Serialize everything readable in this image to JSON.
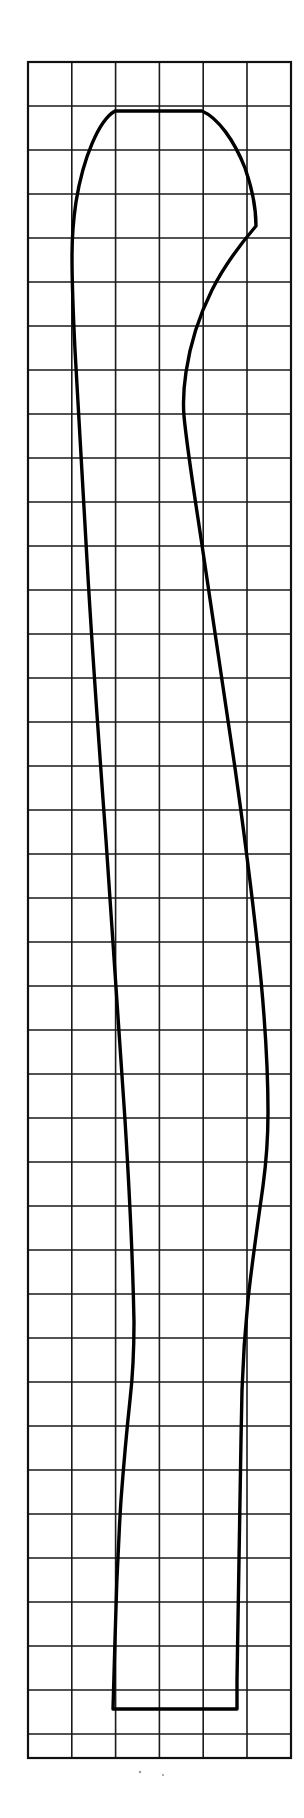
{
  "figure": {
    "background_color": "#ffffff",
    "line_color": "#000000",
    "grid_line_color": "#1a1a1a",
    "canvas": {
      "width": 304,
      "height": 1818
    }
  },
  "grid": {
    "name": "measuring-grid",
    "left": 28,
    "top": 62,
    "right": 291,
    "bottom": 1758,
    "columns": 6,
    "column_width": 43.8,
    "row_height": 44,
    "full_rows": 38,
    "partial_last_row_height": 24,
    "vertical_line_x": [
      28,
      71.8,
      115.6,
      159.4,
      203.2,
      247,
      290.8
    ],
    "horizontal_line_y": [
      62,
      106,
      150,
      194,
      238,
      282,
      326,
      370,
      414,
      458,
      502,
      546,
      590,
      634,
      678,
      722,
      766,
      810,
      854,
      898,
      942,
      986,
      1030,
      1074,
      1118,
      1162,
      1206,
      1250,
      1294,
      1338,
      1382,
      1426,
      1470,
      1514,
      1558,
      1602,
      1646,
      1690,
      1734,
      1758
    ]
  },
  "profile": {
    "name": "profile-outline",
    "closed": true,
    "top_flat_segment": {
      "x_start": 115,
      "x_end": 202,
      "y": 111
    },
    "bottom_flat_segment": {
      "x_start": 63,
      "x_end": 203,
      "y": 1709
    },
    "notch_vertex": {
      "x": 256,
      "y": 226
    },
    "left_path": "M 115,111 C 101,120 86,160 78,205 C 73,234 72,248 72,252 C 72,268 73,286 75,305 C 78,340 82,392 86,455 C 91,533 96,620 101,706 C 107,800 113,898 118,990 C 123,1082 128,1170 131,1250 C 133,1300 134,1345 134,1380 C 133,1400 130,1420 127,1440 L 123,1470 C 120,1500 118,1540 117,1580 L 115,1640 L 113,1690 L 63,1709",
    "right_path": "M 202,111 C 218,118 234,140 245,168 C 252,188 256,210 256,226 L 256,226 C 244,240 226,262 212,290 C 198,318 190,345 186,372 C 183,392 183,404 184,416 C 187,448 194,492 202,545 C 212,612 224,690 235,768 C 246,846 255,918 261,980 C 266,1034 268,1078 268,1112 C 268,1140 266,1164 263,1186 C 258,1222 252,1262 248,1300 C 245,1330 243,1360 242,1390 L 241,1440 L 240,1500 L 239,1560 L 238,1620 L 237,1680 L 203,1709",
    "outline_path": "M 115,111 L 202,111 C 218,118 234,140 245,168 C 252,188 256,210 256,226 C 244,240 226,262 212,290 C 198,318 190,345 186,372 C 183,392 183,404 184,416 C 187,448 194,492 202,545 C 212,612 224,690 235,768 C 246,846 255,918 261,980 C 266,1034 268,1078 268,1112 C 268,1140 266,1164 263,1186 C 258,1222 252,1262 248,1300 C 245,1330 243,1360 242,1390 L 241,1440 L 240,1500 L 239,1560 L 238,1620 L 237,1680 L 237,1709 L 113,1709 L 115,1640 C 116,1596 118,1548 121,1500 C 124,1460 127,1428 130,1400 C 133,1374 134,1350 134,1322 C 133,1270 130,1200 125,1120 C 119,1030 112,930 106,840 C 99,745 92,648 87,560 C 82,480 78,408 75,350 C 73,310 72,278 72,256 C 72,240 73,222 76,202 C 83,158 99,120 115,111 Z"
  },
  "specks": [
    {
      "name": "speck-left",
      "x": 140,
      "y": 1772,
      "r": 1.2
    },
    {
      "name": "speck-right",
      "x": 163,
      "y": 1775,
      "r": 1.1
    }
  ]
}
